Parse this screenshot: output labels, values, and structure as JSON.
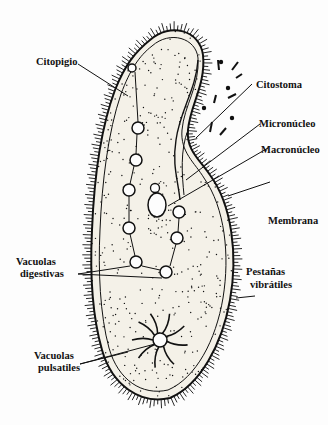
{
  "diagram": {
    "labels": {
      "citopigio": "Citopigio",
      "citostoma": "Citostoma",
      "micronucleo": "Micronúcleo",
      "macronucleo": "Macronúcleo",
      "membrana": "Membrana",
      "vacuolas_digestivas_1": "Vacuolas",
      "vacuolas_digestivas_2": "digestivas",
      "pestanas_1": "Pestañas",
      "pestanas_2": "vibrátiles",
      "vacuolas_pulsatiles_1": "Vacuolas",
      "vacuolas_pulsatiles_2": "pulsatiles"
    },
    "colors": {
      "ink": "#111111",
      "background": "#fdfdfd",
      "cell_fill": "#f4f1e8"
    }
  }
}
